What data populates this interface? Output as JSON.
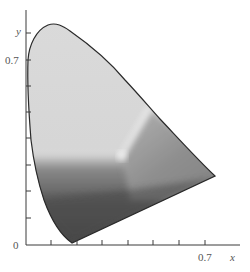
{
  "figure": {
    "type": "chromaticity-diagram",
    "rendering": "grayscale",
    "axis_labels": {
      "x": "x",
      "y": "y"
    },
    "tick_labels": {
      "origin": "0",
      "x_max_labeled": "0.7",
      "y_max_labeled": "0.7"
    },
    "x_ticks": [
      0.1,
      0.2,
      0.3,
      0.4,
      0.5,
      0.6,
      0.7
    ],
    "y_ticks": [
      0.1,
      0.2,
      0.3,
      0.4,
      0.5,
      0.6,
      0.7,
      0.8
    ],
    "colors": {
      "outline": "#2a2a2a",
      "axis": "#3a3a3a",
      "region_top": "#d9d9d9",
      "region_right": "#8c8c8c",
      "region_bottom": "#4a4a4a",
      "white_seam": "#f6f6f6"
    }
  }
}
